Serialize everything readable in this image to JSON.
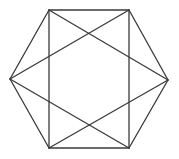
{
  "diagram": {
    "type": "geometric-figure",
    "canvas": {
      "width": 179,
      "height": 159,
      "background": "#ffffff"
    },
    "style": {
      "stroke": "#3a3a3a",
      "stroke_width": 1.3
    },
    "vertices": {
      "top_left": [
        49,
        10
      ],
      "top_right": [
        129,
        10
      ],
      "right": [
        168,
        80
      ],
      "bottom_right": [
        129,
        148
      ],
      "bottom_left": [
        49,
        148
      ],
      "left": [
        10,
        79
      ]
    },
    "edges": [
      {
        "name": "hexagon-edge-top",
        "from": "top_left",
        "to": "top_right"
      },
      {
        "name": "hexagon-edge-upper-right",
        "from": "top_right",
        "to": "right"
      },
      {
        "name": "hexagon-edge-lower-right",
        "from": "right",
        "to": "bottom_right"
      },
      {
        "name": "hexagon-edge-bottom",
        "from": "bottom_right",
        "to": "bottom_left"
      },
      {
        "name": "hexagon-edge-lower-left",
        "from": "bottom_left",
        "to": "left"
      },
      {
        "name": "hexagon-edge-upper-left",
        "from": "left",
        "to": "top_left"
      },
      {
        "name": "rectangle-edge-left",
        "from": "top_left",
        "to": "bottom_left"
      },
      {
        "name": "rectangle-edge-right",
        "from": "top_right",
        "to": "bottom_right"
      },
      {
        "name": "diagonal-top-left-to-right",
        "from": "top_left",
        "to": "right"
      },
      {
        "name": "diagonal-top-right-to-left",
        "from": "top_right",
        "to": "left"
      },
      {
        "name": "diagonal-bottom-left-to-right",
        "from": "bottom_left",
        "to": "right"
      },
      {
        "name": "diagonal-bottom-right-to-left",
        "from": "bottom_right",
        "to": "left"
      }
    ]
  }
}
